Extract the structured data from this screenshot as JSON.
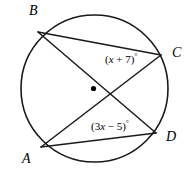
{
  "figure": {
    "type": "circle-geometry-diagram",
    "stroke_color": "#1a1a1a",
    "background_color": "#ffffff",
    "circle": {
      "center_x": 94.5,
      "center_y": 88.5,
      "radius": 73.5,
      "center_dot_radius": 2.6
    },
    "points": {
      "A": {
        "x": 41,
        "y": 147,
        "label": "A"
      },
      "B": {
        "x": 38,
        "y": 32,
        "label": "B"
      },
      "C": {
        "x": 161,
        "y": 55,
        "label": "C"
      },
      "D": {
        "x": 156,
        "y": 133,
        "label": "D"
      }
    },
    "chords": [
      {
        "name": "chord-BC",
        "from": "B",
        "to": "C"
      },
      {
        "name": "chord-BD",
        "from": "B",
        "to": "D"
      },
      {
        "name": "chord-AC",
        "from": "A",
        "to": "C"
      },
      {
        "name": "chord-AD",
        "from": "A",
        "to": "D"
      }
    ],
    "angles": [
      {
        "name": "angle-at-c",
        "vertex": "C",
        "expression_prefix": "(",
        "coefficient_text": "",
        "variable": "x",
        "operator": " + ",
        "constant": "7",
        "expression_suffix": ")",
        "degree_symbol": "°",
        "full_text": "(x + 7)°"
      },
      {
        "name": "angle-at-d",
        "vertex": "D",
        "expression_prefix": "(",
        "coefficient_text": "3",
        "variable": "x",
        "operator": " − ",
        "constant": "5",
        "expression_suffix": ")",
        "degree_symbol": "°",
        "full_text": "(3x − 5)°"
      }
    ]
  }
}
